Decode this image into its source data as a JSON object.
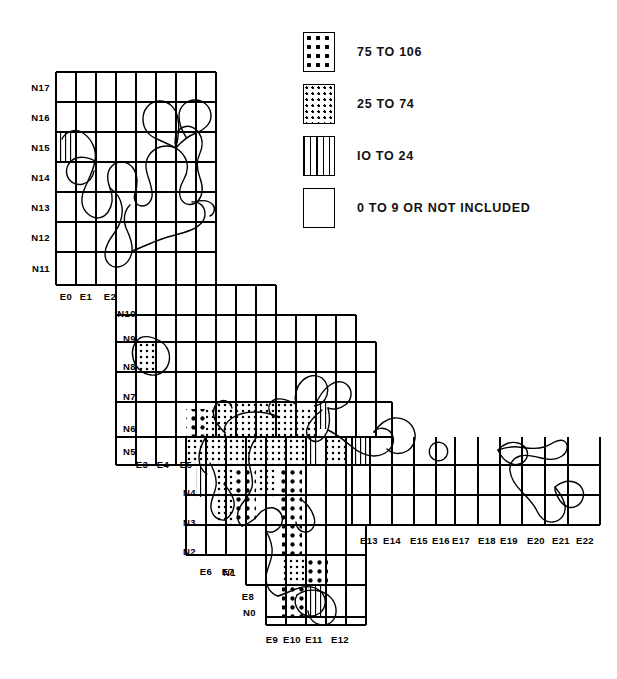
{
  "document": {
    "type": "thematic-grid-map",
    "title": "",
    "background": "#ffffff",
    "ink": "#000000"
  },
  "legend": {
    "name": "map-legend",
    "items": [
      {
        "label": "75 TO 106",
        "pattern": "coarse-dots",
        "pattern_class": "p-high",
        "range_min": 75,
        "range_max": 106
      },
      {
        "label": "25 TO 74",
        "pattern": "fine-dots",
        "pattern_class": "p-mid",
        "range_min": 25,
        "range_max": 74
      },
      {
        "label": "IO TO 24",
        "pattern": "vertical-lines",
        "pattern_class": "p-low",
        "range_min": 10,
        "range_max": 24
      },
      {
        "label": "0 TO 9 OR NOT INCLUDED",
        "pattern": "blank",
        "pattern_class": "p-none",
        "range_min": 0,
        "range_max": 9
      }
    ]
  },
  "grid": {
    "cell_width": 20,
    "cell_height": 30,
    "origin_x": 56,
    "origin_y": 72,
    "stroke": "#000000",
    "stroke_width": 1.1,
    "row_labels": [
      {
        "text": "N17",
        "x": 50,
        "y": 87
      },
      {
        "text": "N16",
        "x": 50,
        "y": 117
      },
      {
        "text": "N15",
        "x": 50,
        "y": 147
      },
      {
        "text": "N14",
        "x": 50,
        "y": 177
      },
      {
        "text": "N13",
        "x": 50,
        "y": 207
      },
      {
        "text": "N12",
        "x": 50,
        "y": 237
      },
      {
        "text": "N11",
        "x": 50,
        "y": 268
      },
      {
        "text": "N10",
        "x": 136,
        "y": 313
      },
      {
        "text": "N9",
        "x": 136,
        "y": 338
      },
      {
        "text": "N8",
        "x": 136,
        "y": 366
      },
      {
        "text": "N7",
        "x": 136,
        "y": 396
      },
      {
        "text": "N6",
        "x": 136,
        "y": 428
      },
      {
        "text": "N5",
        "x": 136,
        "y": 451
      },
      {
        "text": "N4",
        "x": 196,
        "y": 492
      },
      {
        "text": "N3",
        "x": 196,
        "y": 522
      },
      {
        "text": "N2",
        "x": 196,
        "y": 551
      },
      {
        "text": "N1",
        "x": 236,
        "y": 572
      },
      {
        "text": "N0",
        "x": 256,
        "y": 612
      }
    ],
    "col_labels": [
      {
        "text": "E0",
        "x": 66,
        "y": 291
      },
      {
        "text": "E1",
        "x": 86,
        "y": 291
      },
      {
        "text": "E2",
        "x": 110,
        "y": 291
      },
      {
        "text": "E3",
        "x": 142,
        "y": 459
      },
      {
        "text": "E4",
        "x": 163,
        "y": 459
      },
      {
        "text": "E5",
        "x": 186,
        "y": 459
      },
      {
        "text": "E6",
        "x": 206,
        "y": 566
      },
      {
        "text": "E7",
        "x": 228,
        "y": 566
      },
      {
        "text": "E8",
        "x": 248,
        "y": 591
      },
      {
        "text": "E9",
        "x": 272,
        "y": 634
      },
      {
        "text": "E10",
        "x": 292,
        "y": 634
      },
      {
        "text": "E11",
        "x": 314,
        "y": 634
      },
      {
        "text": "E12",
        "x": 340,
        "y": 634
      },
      {
        "text": "E13",
        "x": 369,
        "y": 535
      },
      {
        "text": "E14",
        "x": 392,
        "y": 535
      },
      {
        "text": "E15",
        "x": 419,
        "y": 535
      },
      {
        "text": "E16",
        "x": 441,
        "y": 535
      },
      {
        "text": "E17",
        "x": 461,
        "y": 535
      },
      {
        "text": "E18",
        "x": 487,
        "y": 535
      },
      {
        "text": "E19",
        "x": 509,
        "y": 535
      },
      {
        "text": "E20",
        "x": 536,
        "y": 535
      },
      {
        "text": "E21",
        "x": 561,
        "y": 535
      },
      {
        "text": "E22",
        "x": 585,
        "y": 535
      }
    ]
  },
  "chart_data": {
    "type": "heatmap",
    "title": "",
    "xlabel": "",
    "ylabel": "",
    "legend_position": "top-right",
    "grid": true,
    "x_categories": [
      "E0",
      "E1",
      "E2",
      "E3",
      "E4",
      "E5",
      "E6",
      "E7",
      "E8",
      "E9",
      "E10",
      "E11",
      "E12",
      "E13",
      "E14",
      "E15",
      "E16",
      "E17",
      "E18",
      "E19",
      "E20",
      "E21",
      "E22"
    ],
    "y_categories": [
      "N17",
      "N16",
      "N15",
      "N14",
      "N13",
      "N12",
      "N11",
      "N10",
      "N9",
      "N8",
      "N7",
      "N6",
      "N5",
      "N4",
      "N3",
      "N2",
      "N1",
      "N0"
    ],
    "classes": [
      {
        "name": "75 TO 106",
        "pattern": "coarse-dots"
      },
      {
        "name": "25 TO 74",
        "pattern": "fine-dots"
      },
      {
        "name": "IO TO 24",
        "pattern": "vertical-lines"
      },
      {
        "name": "0 TO 9 OR NOT INCLUDED",
        "pattern": "blank"
      }
    ],
    "shaded_cells": [
      {
        "col": "E0",
        "row": "N15",
        "class": "IO TO 24"
      },
      {
        "col": "E3",
        "row": "N8",
        "class": "25 TO 74"
      },
      {
        "col": "E5",
        "row": "N6",
        "class": "75 TO 106"
      },
      {
        "col": "E6",
        "row": "N6",
        "class": "25 TO 74"
      },
      {
        "col": "E7",
        "row": "N7",
        "class": "25 TO 74"
      },
      {
        "col": "E7",
        "row": "N6",
        "class": "25 TO 74"
      },
      {
        "col": "E8",
        "row": "N7",
        "class": "25 TO 74"
      },
      {
        "col": "E8",
        "row": "N6",
        "class": "25 TO 74"
      },
      {
        "col": "E9",
        "row": "N7",
        "class": "25 TO 74"
      },
      {
        "col": "E9",
        "row": "N6",
        "class": "25 TO 74"
      },
      {
        "col": "E10",
        "row": "N7",
        "class": "25 TO 74"
      },
      {
        "col": "E10",
        "row": "N6",
        "class": "25 TO 74"
      },
      {
        "col": "E11",
        "row": "N6",
        "class": "25 TO 74"
      },
      {
        "col": "E12",
        "row": "N7",
        "class": "IO TO 24"
      },
      {
        "col": "E5",
        "row": "N5",
        "class": "25 TO 74"
      },
      {
        "col": "E6",
        "row": "N5",
        "class": "25 TO 74"
      },
      {
        "col": "E7",
        "row": "N5",
        "class": "25 TO 74"
      },
      {
        "col": "E8",
        "row": "N5",
        "class": "25 TO 74"
      },
      {
        "col": "E9",
        "row": "N5",
        "class": "25 TO 74"
      },
      {
        "col": "E10",
        "row": "N5",
        "class": "25 TO 74"
      },
      {
        "col": "E11",
        "row": "N5",
        "class": "IO TO 24"
      },
      {
        "col": "E12",
        "row": "N5",
        "class": "25 TO 74"
      },
      {
        "col": "E13",
        "row": "N5",
        "class": "IO TO 24"
      },
      {
        "col": "E5",
        "row": "N4",
        "class": "IO TO 24"
      },
      {
        "col": "E6",
        "row": "N4",
        "class": "25 TO 74"
      },
      {
        "col": "E7",
        "row": "N4",
        "class": "75 TO 106"
      },
      {
        "col": "E8",
        "row": "N4",
        "class": "25 TO 74"
      },
      {
        "col": "E9",
        "row": "N4",
        "class": "75 TO 106"
      },
      {
        "col": "E6",
        "row": "N3",
        "class": "25 TO 74"
      },
      {
        "col": "E7",
        "row": "N3",
        "class": "75 TO 106"
      },
      {
        "col": "E9",
        "row": "N3",
        "class": "75 TO 106"
      },
      {
        "col": "E9",
        "row": "N2",
        "class": "75 TO 106"
      },
      {
        "col": "E10",
        "row": "N1",
        "class": "25 TO 74"
      },
      {
        "col": "E11",
        "row": "N1",
        "class": "75 TO 106"
      },
      {
        "col": "E10",
        "row": "N0",
        "class": "75 TO 106"
      },
      {
        "col": "E11",
        "row": "N0",
        "class": "IO TO 24"
      }
    ]
  }
}
